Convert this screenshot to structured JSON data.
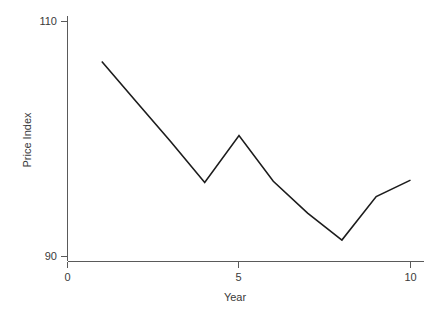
{
  "chart_data": {
    "type": "line",
    "title": "",
    "subtitle": "",
    "xlabel": "Year",
    "ylabel": "Price Index",
    "x": [
      1,
      2,
      3,
      4,
      5,
      6,
      7,
      8,
      9,
      10
    ],
    "series": [
      {
        "name": "Price Index",
        "values": [
          106.6,
          103.2,
          99.8,
          96.3,
          100.3,
          96.4,
          93.7,
          91.4,
          95.1,
          96.5
        ],
        "color": "#1c1c1c"
      }
    ],
    "xlim": [
      0,
      10.4
    ],
    "ylim": [
      90,
      110
    ],
    "xticks": [
      0,
      5,
      10
    ],
    "xtick_labels": [
      "0",
      "5",
      "10"
    ],
    "yticks": [
      90,
      110
    ],
    "ytick_labels": [
      "90",
      "110"
    ],
    "grid": false,
    "legend": false,
    "legend_position": "none",
    "annotations": []
  },
  "axis": {
    "y_top_label": "110",
    "y_bottom_label": "90",
    "x_left_label": "0",
    "x_mid_label": "5",
    "x_right_label": "10",
    "y_title": "Price Index",
    "x_title": "Year"
  },
  "style": {
    "background": "#ffffff",
    "axis_color": "#5a5a5a",
    "line_color": "#1c1c1c",
    "text_color": "#3a3a3a"
  }
}
